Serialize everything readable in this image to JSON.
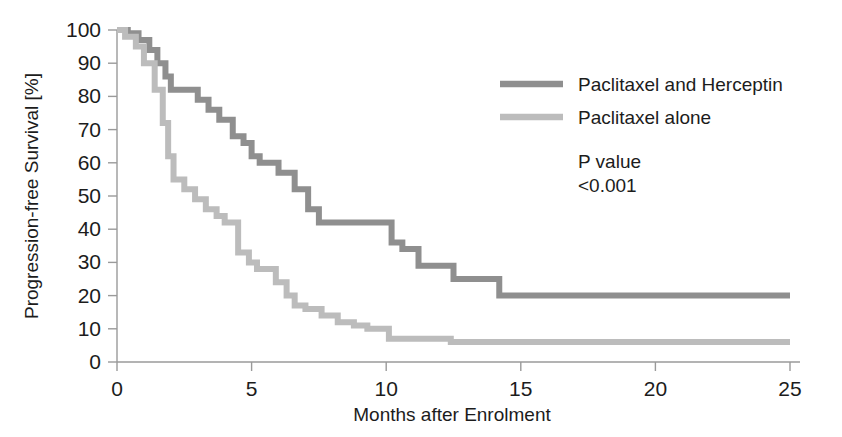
{
  "chart_data": {
    "type": "line",
    "title": "",
    "subtitle": "",
    "xlabel": "Months after Enrolment",
    "ylabel": "Progression-free Survival [%]",
    "xlim": [
      0,
      25
    ],
    "ylim": [
      0,
      100
    ],
    "xticks": [
      0,
      5,
      10,
      15,
      20,
      25
    ],
    "yticks": [
      0,
      10,
      20,
      30,
      40,
      50,
      60,
      70,
      80,
      90,
      100
    ],
    "xtick_labels": [
      "0",
      "5",
      "10",
      "15",
      "20",
      "25"
    ],
    "ytick_labels": [
      "0",
      "10",
      "20",
      "30",
      "40",
      "50",
      "60",
      "70",
      "80",
      "90",
      "100"
    ],
    "grid": false,
    "legend_position": "upper-right",
    "step_shape": "post",
    "annotations": [
      {
        "name": "p-value-label",
        "text": "P value"
      },
      {
        "name": "p-value-number",
        "text": "<0.001"
      }
    ],
    "series": [
      {
        "name": "Paclitaxel and Herceptin",
        "color": "#8f8f8f",
        "points": [
          [
            0.0,
            100
          ],
          [
            0.4,
            99
          ],
          [
            0.8,
            97
          ],
          [
            1.2,
            94
          ],
          [
            1.5,
            90
          ],
          [
            1.8,
            86
          ],
          [
            2.0,
            82
          ],
          [
            2.6,
            82
          ],
          [
            3.0,
            79
          ],
          [
            3.4,
            76
          ],
          [
            3.8,
            73
          ],
          [
            4.1,
            73
          ],
          [
            4.3,
            68
          ],
          [
            4.7,
            66
          ],
          [
            5.0,
            62
          ],
          [
            5.3,
            60
          ],
          [
            5.7,
            60
          ],
          [
            6.0,
            57
          ],
          [
            6.6,
            52
          ],
          [
            7.1,
            46
          ],
          [
            7.5,
            42
          ],
          [
            9.9,
            42
          ],
          [
            10.2,
            36
          ],
          [
            10.6,
            34
          ],
          [
            11.0,
            34
          ],
          [
            11.2,
            29
          ],
          [
            12.3,
            29
          ],
          [
            12.5,
            25
          ],
          [
            14.0,
            25
          ],
          [
            14.2,
            20
          ],
          [
            25.0,
            20
          ]
        ]
      },
      {
        "name": "Paclitaxel alone",
        "color": "#bcbcbc",
        "points": [
          [
            0.0,
            100
          ],
          [
            0.3,
            98
          ],
          [
            0.7,
            95
          ],
          [
            1.0,
            90
          ],
          [
            1.4,
            82
          ],
          [
            1.7,
            72
          ],
          [
            1.9,
            62
          ],
          [
            2.1,
            55
          ],
          [
            2.5,
            52
          ],
          [
            2.9,
            49
          ],
          [
            3.3,
            46
          ],
          [
            3.7,
            44
          ],
          [
            4.0,
            42
          ],
          [
            4.3,
            42
          ],
          [
            4.5,
            33
          ],
          [
            4.9,
            30
          ],
          [
            5.2,
            28
          ],
          [
            5.6,
            28
          ],
          [
            5.9,
            24
          ],
          [
            6.3,
            20
          ],
          [
            6.6,
            17
          ],
          [
            7.0,
            16
          ],
          [
            7.6,
            14
          ],
          [
            8.2,
            12
          ],
          [
            8.8,
            11
          ],
          [
            9.3,
            10
          ],
          [
            9.9,
            10
          ],
          [
            10.1,
            7
          ],
          [
            12.2,
            7
          ],
          [
            12.4,
            6
          ],
          [
            25.0,
            6
          ]
        ]
      }
    ]
  },
  "legend": {
    "items": [
      {
        "label": "Paclitaxel and Herceptin",
        "color": "#8f8f8f"
      },
      {
        "label": "Paclitaxel alone",
        "color": "#bcbcbc"
      }
    ]
  },
  "pvalue": {
    "label": "P value",
    "value": "<0.001"
  },
  "axes": {
    "x_title": "Months after Enrolment",
    "y_title": "Progression-free Survival [%]"
  }
}
